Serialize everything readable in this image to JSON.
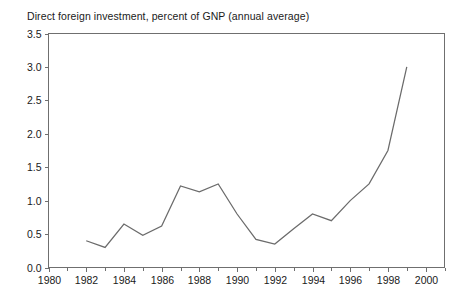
{
  "chart_data": {
    "type": "line",
    "title": "Direct foreign investment, percent of GNP (annual average)",
    "xlabel": "",
    "ylabel": "",
    "xlim": [
      1980,
      2001
    ],
    "ylim": [
      0.0,
      3.5
    ],
    "grid": false,
    "legend": null,
    "x": [
      1982,
      1983,
      1984,
      1985,
      1986,
      1987,
      1988,
      1989,
      1990,
      1991,
      1992,
      1993,
      1994,
      1995,
      1996,
      1997,
      1998,
      1999
    ],
    "values": [
      0.4,
      0.3,
      0.65,
      0.48,
      0.62,
      1.22,
      1.13,
      1.25,
      0.8,
      0.42,
      0.35,
      0.58,
      0.8,
      0.7,
      1.0,
      1.25,
      1.75,
      3.0
    ],
    "series": [
      {
        "name": "Direct foreign investment, percent of GNP",
        "values": [
          0.4,
          0.3,
          0.65,
          0.48,
          0.62,
          1.22,
          1.13,
          1.25,
          0.8,
          0.42,
          0.35,
          0.58,
          0.8,
          0.7,
          1.0,
          1.25,
          1.75,
          3.0
        ]
      }
    ],
    "y_ticks": [
      "0.0",
      "0.5",
      "1.0",
      "1.5",
      "2.0",
      "2.5",
      "3.0",
      "3.5"
    ],
    "y_tick_values": [
      0.0,
      0.5,
      1.0,
      1.5,
      2.0,
      2.5,
      3.0,
      3.5
    ],
    "x_ticks": [
      "1980",
      "1982",
      "1984",
      "1986",
      "1988",
      "1990",
      "1992",
      "1994",
      "1996",
      "1998",
      "2000"
    ],
    "x_tick_values": [
      1980,
      1982,
      1984,
      1986,
      1988,
      1990,
      1992,
      1994,
      1996,
      1998,
      2000
    ],
    "x_minor_tick_values": [
      1981,
      1983,
      1985,
      1987,
      1989,
      1991,
      1993,
      1995,
      1997,
      1999,
      2001
    ],
    "line_color": "#6b6b6b",
    "axis_color": "#6f6f6f",
    "background_color": "#ffffff",
    "text_color": "#1a1a1a"
  }
}
